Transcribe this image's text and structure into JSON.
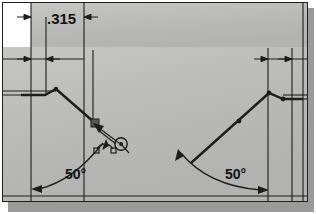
{
  "drawing": {
    "title": "Sheet metal bend profile drawing",
    "background_color": "#b9b9b7",
    "line_color": "#1d1d1c",
    "frame_border_color": "#20201f",
    "shadow_color": "#9a9a9a",
    "white_patch_color": "#ffffff"
  },
  "dimensions": {
    "linear": [
      {
        "id": "width-315",
        "label": ".315",
        "value": 0.315,
        "units": "in",
        "orientation": "horizontal",
        "position": "top-left"
      }
    ],
    "angular": [
      {
        "id": "angle-left",
        "label": "50°",
        "value": 50,
        "units": "deg",
        "position": "bottom-left"
      },
      {
        "id": "angle-right",
        "label": "50°",
        "value": 50,
        "units": "deg",
        "position": "bottom-right"
      }
    ]
  },
  "geometry": {
    "left_profile": {
      "name": "left-bend-profile",
      "points": [
        [
          18,
          92
        ],
        [
          42,
          92
        ],
        [
          53,
          86
        ],
        [
          92,
          120
        ]
      ],
      "endpoint_marker": [
        92,
        120
      ]
    },
    "right_profile": {
      "name": "right-bend-profile",
      "points": [
        [
          188,
          160
        ],
        [
          236,
          118
        ],
        [
          266,
          90
        ],
        [
          280,
          96
        ],
        [
          300,
          96
        ]
      ],
      "midpoint_marker": [
        236,
        118
      ]
    }
  },
  "cursor": {
    "name": "sketch-pointer",
    "snap_glyph": "arc-snap",
    "position": [
      112,
      138
    ],
    "visible": true
  },
  "status": {
    "selected_entity": "line",
    "snap_mode": "arc-center"
  }
}
